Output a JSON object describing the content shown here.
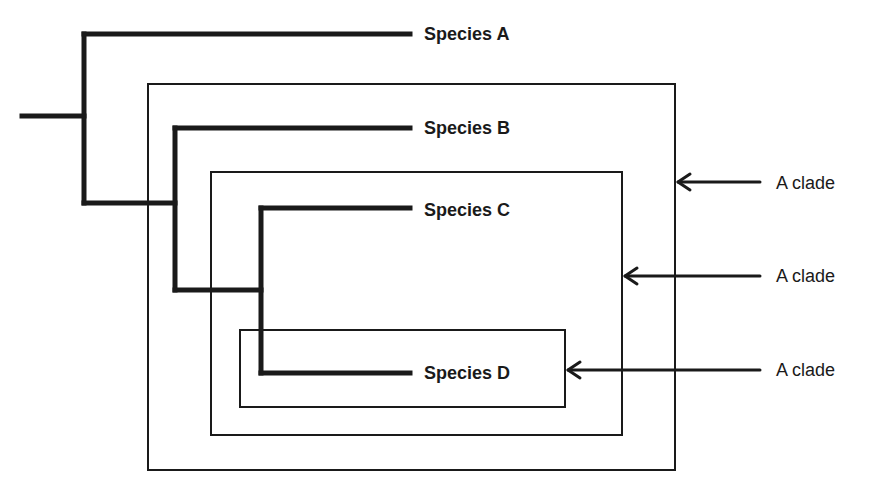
{
  "diagram": {
    "type": "cladogram",
    "colors": {
      "line": "#1a1a1a",
      "background": "#ffffff"
    },
    "species": [
      {
        "label": "Species A"
      },
      {
        "label": "Species B"
      },
      {
        "label": "Species C"
      },
      {
        "label": "Species D"
      }
    ],
    "clades": [
      {
        "label": "A clade",
        "members": [
          "Species B",
          "Species C",
          "Species D"
        ]
      },
      {
        "label": "A clade",
        "members": [
          "Species C",
          "Species D"
        ]
      },
      {
        "label": "A clade",
        "members": [
          "Species D"
        ]
      }
    ]
  }
}
